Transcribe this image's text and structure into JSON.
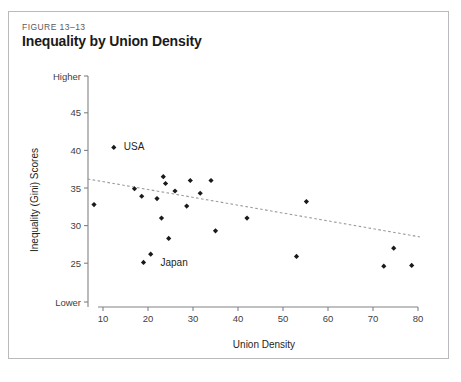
{
  "figure": {
    "number": "FIGURE 13–13",
    "title": "Inequality by Union Density"
  },
  "chart_data": {
    "type": "scatter",
    "title": "Inequality by Union Density",
    "xlabel": "Union Density",
    "ylabel": "Inequality (Gini) Scores",
    "xlim": [
      5,
      82
    ],
    "ylim": [
      22.5,
      48
    ],
    "grid": false,
    "legend": "none",
    "xticks": [
      10,
      20,
      30,
      40,
      50,
      60,
      70,
      80
    ],
    "xtick_labels": [
      "10",
      "20",
      "30",
      "40",
      "50",
      "60",
      "70",
      "80"
    ],
    "yticks": [
      45,
      40,
      35,
      30,
      25
    ],
    "ytick_labels": [
      "45",
      "40",
      "35",
      "30",
      "25"
    ],
    "y_axis_top_label": "Higher",
    "y_axis_bottom_label": "Lower",
    "points": [
      {
        "x": 8.0,
        "y": 32.8,
        "label": ""
      },
      {
        "x": 12.4,
        "y": 40.4,
        "label": "USA"
      },
      {
        "x": 17.0,
        "y": 34.9,
        "label": ""
      },
      {
        "x": 18.6,
        "y": 33.9,
        "label": ""
      },
      {
        "x": 19.0,
        "y": 25.1,
        "label": "Japan"
      },
      {
        "x": 20.6,
        "y": 26.2,
        "label": ""
      },
      {
        "x": 22.0,
        "y": 33.6,
        "label": ""
      },
      {
        "x": 23.0,
        "y": 31.0,
        "label": ""
      },
      {
        "x": 23.4,
        "y": 36.5,
        "label": ""
      },
      {
        "x": 23.9,
        "y": 35.6,
        "label": ""
      },
      {
        "x": 24.6,
        "y": 28.3,
        "label": ""
      },
      {
        "x": 26.0,
        "y": 34.6,
        "label": ""
      },
      {
        "x": 28.6,
        "y": 32.6,
        "label": ""
      },
      {
        "x": 29.4,
        "y": 36.0,
        "label": ""
      },
      {
        "x": 31.6,
        "y": 34.3,
        "label": ""
      },
      {
        "x": 34.0,
        "y": 36.0,
        "label": ""
      },
      {
        "x": 35.0,
        "y": 29.3,
        "label": ""
      },
      {
        "x": 42.0,
        "y": 31.0,
        "label": ""
      },
      {
        "x": 53.0,
        "y": 25.9,
        "label": ""
      },
      {
        "x": 55.2,
        "y": 33.2,
        "label": ""
      },
      {
        "x": 72.4,
        "y": 24.6,
        "label": ""
      },
      {
        "x": 74.6,
        "y": 27.0,
        "label": ""
      },
      {
        "x": 78.6,
        "y": 24.7,
        "label": ""
      }
    ],
    "trendline": {
      "style": "dotted",
      "x0": 6.6,
      "y0": 36.2,
      "x1": 80.4,
      "y1": 28.5
    },
    "annotations": [
      {
        "text": "USA",
        "x": 12.4,
        "y": 40.4,
        "dx": 10,
        "dy": 3
      },
      {
        "text": "Japan",
        "x": 19.0,
        "y": 25.1,
        "dx": 17,
        "dy": 4
      }
    ]
  }
}
